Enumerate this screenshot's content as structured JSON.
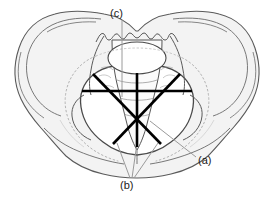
{
  "figure": {
    "type": "anatomical-diagram",
    "background_color": "#ffffff",
    "bone_outline_color": "#555555",
    "bone_fill_color": "#f2f2f2",
    "inner_fill_color": "#ffffff",
    "measurement_line_color": "#000000",
    "leader_line_color": "#9a9a9a",
    "dotted_inlet_color": "#b0b0b0"
  },
  "labels": [
    {
      "id": "a",
      "text": "(a)",
      "meaning": "oblique diameter",
      "x": 198,
      "y": 155
    },
    {
      "id": "b",
      "text": "(b)",
      "meaning": "transverse and oblique diameters convergence",
      "x": 120,
      "y": 180
    },
    {
      "id": "c",
      "text": "(c)",
      "meaning": "anteroposterior (conjugate) diameter",
      "x": 110,
      "y": 8
    }
  ],
  "measurement_lines": [
    {
      "name": "transverse-diameter",
      "orientation": "horizontal",
      "x1": 82,
      "y1": 91,
      "x2": 192,
      "y2": 91,
      "stroke": "#000000",
      "width": 2.6
    },
    {
      "name": "anteroposterior-diameter",
      "orientation": "vertical",
      "x1": 137,
      "y1": 73,
      "x2": 137,
      "y2": 147,
      "stroke": "#000000",
      "width": 2.6
    },
    {
      "name": "left-oblique-diameter",
      "orientation": "diagonal-down-right",
      "x1": 93,
      "y1": 74,
      "x2": 161,
      "y2": 144,
      "stroke": "#000000",
      "width": 2.6
    },
    {
      "name": "right-oblique-diameter",
      "orientation": "diagonal-down-left",
      "x1": 180,
      "y1": 74,
      "x2": 113,
      "y2": 144,
      "stroke": "#000000",
      "width": 2.6
    }
  ],
  "leader_lines": [
    {
      "name": "leader-c",
      "x1": 122,
      "y1": 20,
      "x2": 122,
      "y2": 97
    },
    {
      "name": "leader-a",
      "x1": 196,
      "y1": 157,
      "x2": 150,
      "y2": 121
    },
    {
      "name": "leader-b-left",
      "x1": 130,
      "y1": 178,
      "x2": 117,
      "y2": 143
    },
    {
      "name": "leader-b-centre",
      "x1": 132,
      "y1": 178,
      "x2": 137,
      "y2": 143
    },
    {
      "name": "leader-b-right",
      "x1": 134,
      "y1": 178,
      "x2": 158,
      "y2": 143
    }
  ],
  "central_point": {
    "x": 137,
    "y": 120
  },
  "sacral_oval": {
    "cx": 137,
    "cy": 58,
    "rx": 29,
    "ry": 16
  }
}
